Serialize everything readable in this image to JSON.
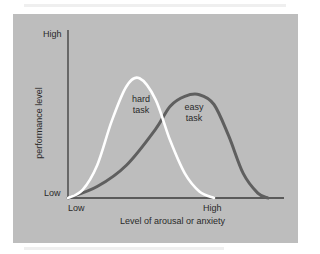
{
  "chart_data": {
    "type": "line",
    "title": "",
    "xlabel": "Level of arousal or anxiety",
    "ylabel": "performance level",
    "x_ticks": [
      "Low",
      "High"
    ],
    "y_ticks": [
      "Low",
      "High"
    ],
    "xlim": [
      0,
      1.45
    ],
    "ylim": [
      0,
      1
    ],
    "grid": false,
    "legend": "inline labels on curves",
    "series": [
      {
        "name": "hard task",
        "label_lines": [
          "hard",
          "task"
        ],
        "color": "#ffffff",
        "x": [
          0.0,
          0.1,
          0.2,
          0.3,
          0.4,
          0.49,
          0.6,
          0.7,
          0.8,
          0.9,
          1.0
        ],
        "y": [
          0.0,
          0.05,
          0.2,
          0.47,
          0.68,
          0.73,
          0.6,
          0.35,
          0.15,
          0.04,
          0.0
        ]
      },
      {
        "name": "easy task",
        "label_lines": [
          "easy",
          "task"
        ],
        "color": "#5f5f5f",
        "x": [
          0.0,
          0.2,
          0.4,
          0.6,
          0.7,
          0.8,
          0.9,
          1.0,
          1.1,
          1.2,
          1.3,
          1.37
        ],
        "y": [
          0.0,
          0.07,
          0.2,
          0.42,
          0.56,
          0.62,
          0.63,
          0.57,
          0.38,
          0.15,
          0.03,
          0.0
        ]
      }
    ]
  },
  "axes": {
    "y_high": "High",
    "y_low": "Low",
    "x_low": "Low",
    "x_high": "High",
    "x_title": "Level of arousal or anxiety",
    "y_title": "performance level"
  },
  "colors": {
    "panel": "#bdbdbd",
    "axis": "#3a3a3a",
    "hard_task": "#ffffff",
    "easy_task": "#5f5f5f"
  }
}
